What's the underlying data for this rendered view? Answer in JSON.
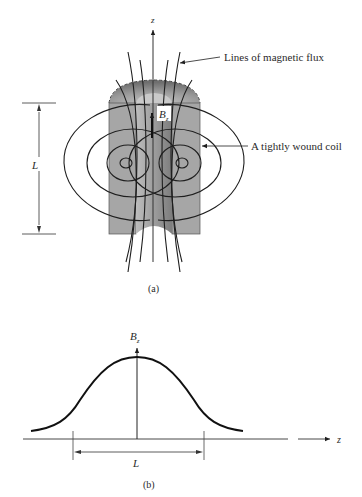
{
  "figure_a": {
    "caption": "(a)",
    "axis_label": "z",
    "field_label": "B",
    "field_subscript": "z",
    "length_label": "L",
    "annotations": {
      "flux": "Lines of magnetic flux",
      "coil": "A tightly wound coil"
    }
  },
  "figure_b": {
    "caption": "(b)",
    "y_axis_label": "B",
    "y_axis_subscript": "z",
    "x_axis_label": "z",
    "length_label": "L"
  },
  "colors": {
    "coil_outer": "#a9a9a9",
    "coil_inner": "#8c8c8c",
    "core": "#b8b8b8",
    "line": "#1e1e1e"
  }
}
